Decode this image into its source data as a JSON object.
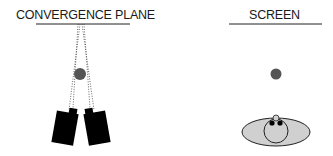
{
  "left_panel": {
    "title": "CONVERGENCE PLANE"
  },
  "right_panel": {
    "title": "SCREEN"
  },
  "colors": {
    "line": "#222222",
    "dot": "#555555",
    "camera": "#000000",
    "ellipse_fill": "#d0d0d0"
  }
}
